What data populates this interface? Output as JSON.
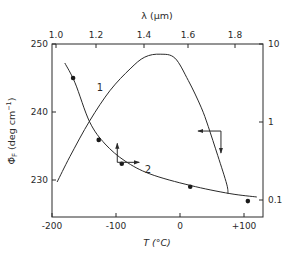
{
  "chart_data": {
    "type": "line",
    "title": "",
    "top_axis": {
      "label": "λ (μm)",
      "ticks": [
        {
          "label": "1.0",
          "x_px": 56
        },
        {
          "label": "1.2",
          "x_px": 96
        },
        {
          "label": "1.4",
          "x_px": 144
        },
        {
          "label": "1.6",
          "x_px": 188
        },
        {
          "label": "1.8",
          "x_px": 235
        }
      ]
    },
    "xlabel": "T (°C)",
    "xlim": [
      -200,
      130
    ],
    "xticks": [
      {
        "label": "-200",
        "value": -200
      },
      {
        "label": "-100",
        "value": -100
      },
      {
        "label": "0",
        "value": 0
      },
      {
        "label": "+100",
        "value": 100
      }
    ],
    "ylabel": "Φ̄F (deg cm⁻¹)",
    "ylabel_main": "Φ̄",
    "ylabel_sub": "F",
    "ylabel_unit": " (deg cm",
    "ylabel_exp": "−1",
    "ylabel_close": ")",
    "ylim": [
      224.5,
      250
    ],
    "yticks": [
      {
        "label": "250",
        "value": 250
      },
      {
        "label": "240",
        "value": 240
      },
      {
        "label": "230",
        "value": 230
      }
    ],
    "y2_scale": "log",
    "y2lim": [
      0.065,
      10
    ],
    "y2ticks": [
      {
        "label": "10",
        "value": 10
      },
      {
        "label": "1",
        "value": 1
      },
      {
        "label": "0.1",
        "value": 0.1
      }
    ],
    "series": [
      {
        "name": "1",
        "axis": "right",
        "label_pos": {
          "T": -125,
          "v": 2.5
        },
        "T": [
          -192,
          -172,
          -141,
          -109,
          -78,
          -55,
          -31,
          -8,
          13,
          33,
          44,
          59,
          73,
          75
        ],
        "values": [
          0.17,
          0.36,
          1.04,
          2.55,
          4.8,
          6.8,
          7.4,
          6.6,
          3.4,
          1.55,
          0.88,
          0.37,
          0.16,
          0.12
        ]
      },
      {
        "name": "2",
        "axis": "left",
        "label_pos": {
          "T": -50,
          "v": 231.0
        },
        "T": [
          -180,
          -164,
          -141,
          -117,
          -86,
          -47,
          16,
          78,
          120
        ],
        "values": [
          247.2,
          244.3,
          238.5,
          235.3,
          232.8,
          230.9,
          229.2,
          228.0,
          227.5
        ]
      }
    ],
    "points": {
      "axis": "left",
      "T": [
        -167,
        -127,
        -91,
        16,
        106
      ],
      "values": [
        245.0,
        235.9,
        232.4,
        229.0,
        226.9
      ]
    },
    "annotations": [
      {
        "type": "arrow-pair",
        "origin": {
          "T": -98,
          "v": 232.6
        },
        "arrows": [
          "up",
          "right"
        ],
        "meaning": "curve 2 uses left and bottom axes"
      },
      {
        "type": "arrow-pair",
        "origin": {
          "T": 64,
          "v": 237.2
        },
        "arrows": [
          "left",
          "down"
        ],
        "meaning": "curve 1 uses top and right axes"
      }
    ],
    "grid": false,
    "legend": null
  }
}
